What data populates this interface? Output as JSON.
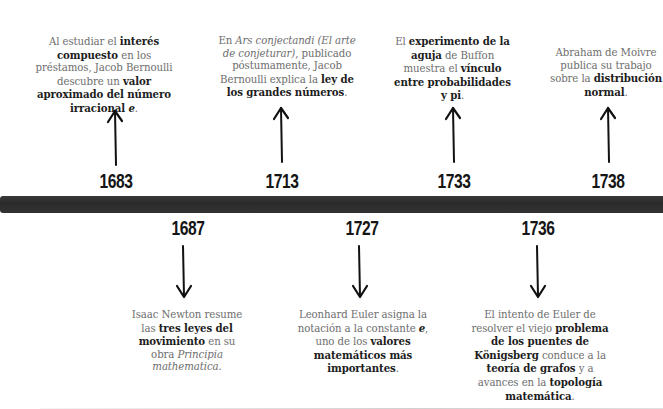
{
  "timeline": {
    "above": [
      {
        "year": "1683",
        "parts": [
          {
            "t": "Al estudiar el ",
            "s": "n"
          },
          {
            "t": "interés compuesto",
            "s": "b"
          },
          {
            "t": " en los préstamos, Jacob Bernoulli descubre un ",
            "s": "n"
          },
          {
            "t": "valor aproximado del número irracional ",
            "s": "b"
          },
          {
            "t": "e",
            "s": "bi"
          },
          {
            "t": ".",
            "s": "n"
          }
        ]
      },
      {
        "year": "1713",
        "parts": [
          {
            "t": "En ",
            "s": "n"
          },
          {
            "t": "Ars conjectandi (El arte de conjeturar)",
            "s": "i"
          },
          {
            "t": ", publicado póstumamente, Jacob Bernoulli explica la ",
            "s": "n"
          },
          {
            "t": "ley de los grandes números",
            "s": "b"
          },
          {
            "t": ".",
            "s": "n"
          }
        ]
      },
      {
        "year": "1733",
        "parts": [
          {
            "t": "El ",
            "s": "n"
          },
          {
            "t": "experimento de la aguja",
            "s": "b"
          },
          {
            "t": " de Buffon muestra el ",
            "s": "n"
          },
          {
            "t": "vínculo entre probabilidades y pi",
            "s": "b"
          },
          {
            "t": ".",
            "s": "n"
          }
        ]
      },
      {
        "year": "1738",
        "parts": [
          {
            "t": "Abraham de Moivre publica su trabajo sobre la ",
            "s": "n"
          },
          {
            "t": "distribución normal",
            "s": "b"
          },
          {
            "t": ".",
            "s": "n"
          }
        ]
      }
    ],
    "below": [
      {
        "year": "1687",
        "parts": [
          {
            "t": "Isaac Newton resume las ",
            "s": "n"
          },
          {
            "t": "tres leyes del movimiento",
            "s": "b"
          },
          {
            "t": " en su obra ",
            "s": "n"
          },
          {
            "t": "Principia mathematica",
            "s": "i"
          },
          {
            "t": ".",
            "s": "n"
          }
        ]
      },
      {
        "year": "1727",
        "parts": [
          {
            "t": "Leonhard Euler asigna la notación a la constante ",
            "s": "n"
          },
          {
            "t": "e",
            "s": "bi"
          },
          {
            "t": ", uno de los ",
            "s": "n"
          },
          {
            "t": "valores matemáticos más importantes",
            "s": "b"
          },
          {
            "t": ".",
            "s": "n"
          }
        ]
      },
      {
        "year": "1736",
        "parts": [
          {
            "t": "El intento de Euler de resolver el viejo ",
            "s": "n"
          },
          {
            "t": "problema de los puentes de Königsberg",
            "s": "b"
          },
          {
            "t": " conduce a la ",
            "s": "n"
          },
          {
            "t": "teoría de grafos",
            "s": "b"
          },
          {
            "t": " y a avances en la ",
            "s": "n"
          },
          {
            "t": "topología matemática",
            "s": "b"
          },
          {
            "t": ".",
            "s": "n"
          }
        ]
      }
    ]
  }
}
